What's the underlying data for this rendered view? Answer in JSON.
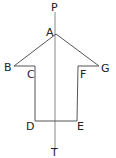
{
  "diagram": {
    "type": "symmetric-arrow-shape",
    "axis": {
      "top_label": "P",
      "bottom_label": "T"
    },
    "points": [
      {
        "name": "A",
        "label": "A",
        "x": 56,
        "y": 34
      },
      {
        "name": "B",
        "label": "B",
        "x": 14,
        "y": 66
      },
      {
        "name": "C",
        "label": "C",
        "x": 35,
        "y": 66
      },
      {
        "name": "D",
        "label": "D",
        "x": 35,
        "y": 121
      },
      {
        "name": "E",
        "label": "E",
        "x": 77,
        "y": 121
      },
      {
        "name": "F",
        "label": "F",
        "x": 78,
        "y": 66
      },
      {
        "name": "G",
        "label": "G",
        "x": 99,
        "y": 66
      }
    ]
  }
}
